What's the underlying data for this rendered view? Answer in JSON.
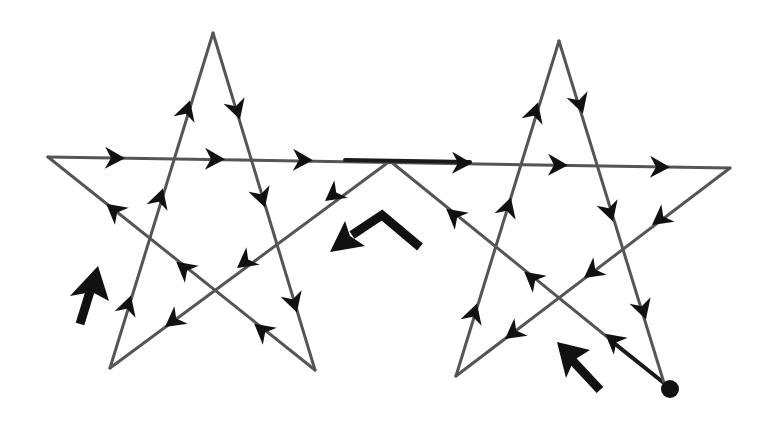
{
  "diagram": {
    "type": "single-stroke path drawing of two connected pentagrams",
    "colors": {
      "background": "#ffffff",
      "line": "#555555",
      "arrow": "#111111"
    },
    "start_point": {
      "x": 670,
      "y": 389,
      "marker": "filled-dot"
    },
    "path_vertices": [
      {
        "id": "start",
        "x": 664,
        "y": 383
      },
      {
        "id": "junction",
        "x": 390,
        "y": 161
      },
      {
        "id": "left-star-bottom-left",
        "x": 110,
        "y": 368
      },
      {
        "id": "left-star-top",
        "x": 213,
        "y": 33
      },
      {
        "id": "left-star-bottom-right",
        "x": 315,
        "y": 370
      },
      {
        "id": "left-star-left",
        "x": 48,
        "y": 157
      },
      {
        "id": "right-star-right",
        "x": 730,
        "y": 168
      },
      {
        "id": "right-star-bottom-left",
        "x": 456,
        "y": 376
      },
      {
        "id": "right-star-top",
        "x": 559,
        "y": 41
      },
      {
        "id": "end",
        "x": 664,
        "y": 383
      }
    ],
    "direction_hint_arrows": [
      {
        "id": "left-hint",
        "direction": "up",
        "x": 88,
        "y": 290
      },
      {
        "id": "center-hint",
        "direction": "down-left",
        "x": 360,
        "y": 235
      },
      {
        "id": "right-hint",
        "direction": "up-left",
        "x": 575,
        "y": 360
      }
    ]
  }
}
